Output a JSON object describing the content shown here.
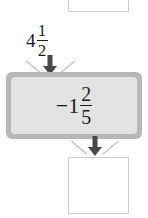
{
  "diagram": {
    "type": "function-machine",
    "input_box": {
      "value": "",
      "placeholder": "",
      "state": "empty-clipped"
    },
    "input_label": {
      "whole": "4",
      "numerator": "1",
      "denominator": "2",
      "text": "4 1/2"
    },
    "machine": {
      "operation_sign": "−",
      "whole": "1",
      "numerator": "2",
      "denominator": "5",
      "text": "-1 2/5"
    },
    "output_box": {
      "value": "",
      "placeholder": "",
      "state": "empty"
    },
    "arrows": {
      "top": "down-arrow",
      "bottom": "down-arrow"
    },
    "colors": {
      "machine_border": "#b7b7b7",
      "machine_fill": "#e3e3e3",
      "box_border": "#cdcdcd",
      "arrow": "#4a4a4a",
      "spark": "#b0b0b0",
      "text": "#1d1d1d",
      "background": "#ffffff"
    }
  }
}
